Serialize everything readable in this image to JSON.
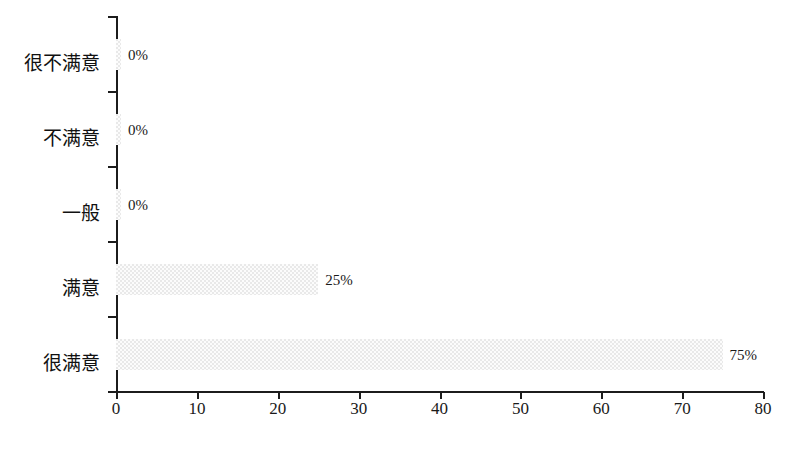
{
  "chart_data": {
    "type": "bar",
    "orientation": "horizontal",
    "title": "",
    "subtitle": "",
    "xlabel": "",
    "ylabel": "",
    "categories": [
      "很不满意",
      "不满意",
      "一般",
      "满意",
      "很满意"
    ],
    "values": [
      0,
      0,
      0,
      25,
      75
    ],
    "data_labels": [
      "0%",
      "0%",
      "0%",
      "25%",
      "75%"
    ],
    "xlim": [
      0,
      80
    ],
    "xticks": [
      0,
      10,
      20,
      30,
      40,
      50,
      60,
      70,
      80
    ],
    "xtick_labels": [
      "0",
      "10",
      "20",
      "30",
      "40",
      "50",
      "60",
      "70",
      "80"
    ],
    "grid": false,
    "legend": false,
    "bar_color": "#e9e9e9",
    "axis_color": "#1c1c1c",
    "background": "#ffffff"
  }
}
